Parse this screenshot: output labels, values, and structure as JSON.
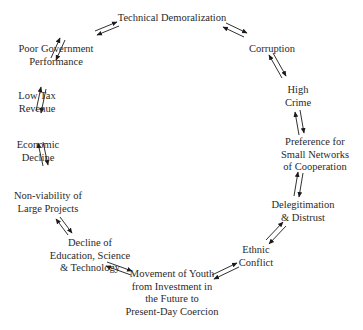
{
  "diagram": {
    "type": "cycle",
    "nodes": [
      {
        "id": "technical-demoralization",
        "lines": [
          "Technical Demoralization"
        ]
      },
      {
        "id": "corruption",
        "lines": [
          "Corruption"
        ]
      },
      {
        "id": "high-crime",
        "lines": [
          "High",
          "Crime"
        ]
      },
      {
        "id": "preference-small-networks",
        "lines": [
          "Preference for",
          "Small Networks",
          "of Cooperation"
        ]
      },
      {
        "id": "delegitimation-distrust",
        "lines": [
          "Delegitimation",
          "& Distrust"
        ]
      },
      {
        "id": "ethnic-conflict",
        "lines": [
          "Ethnic",
          "Conflict"
        ]
      },
      {
        "id": "movement-of-youth",
        "lines": [
          "Movement of Youth",
          "from Investment in",
          "the Future to",
          "Present-Day Coercion"
        ]
      },
      {
        "id": "decline-education",
        "lines": [
          "Decline of",
          "Education, Science",
          "& Technology"
        ]
      },
      {
        "id": "non-viability",
        "lines": [
          "Non-viability of",
          "Large Projects"
        ]
      },
      {
        "id": "economic-decline",
        "lines": [
          "Economic",
          "Decline"
        ]
      },
      {
        "id": "low-tax-revenue",
        "lines": [
          "Low Tax",
          "Revenue"
        ]
      },
      {
        "id": "poor-government-performance",
        "lines": [
          "Poor Government",
          "Performance"
        ]
      }
    ],
    "edges": [
      {
        "from": "technical-demoralization",
        "to": "corruption",
        "bidirectional": true
      },
      {
        "from": "corruption",
        "to": "high-crime",
        "bidirectional": true
      },
      {
        "from": "high-crime",
        "to": "preference-small-networks",
        "bidirectional": true
      },
      {
        "from": "preference-small-networks",
        "to": "delegitimation-distrust",
        "bidirectional": true
      },
      {
        "from": "delegitimation-distrust",
        "to": "ethnic-conflict",
        "bidirectional": true
      },
      {
        "from": "ethnic-conflict",
        "to": "movement-of-youth",
        "bidirectional": true
      },
      {
        "from": "movement-of-youth",
        "to": "decline-education",
        "bidirectional": true
      },
      {
        "from": "decline-education",
        "to": "non-viability",
        "bidirectional": true
      },
      {
        "from": "non-viability",
        "to": "economic-decline",
        "bidirectional": true
      },
      {
        "from": "economic-decline",
        "to": "low-tax-revenue",
        "bidirectional": true
      },
      {
        "from": "low-tax-revenue",
        "to": "poor-government-performance",
        "bidirectional": true
      },
      {
        "from": "poor-government-performance",
        "to": "technical-demoralization",
        "bidirectional": true
      }
    ],
    "colors": {
      "text": "#2a2a2a",
      "arrow": "#1a1a1a",
      "background": "#ffffff"
    }
  }
}
